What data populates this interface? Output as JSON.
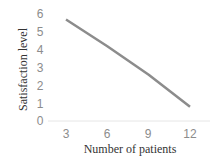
{
  "chart_data": {
    "type": "line",
    "title": "",
    "xlabel": "Number of patients",
    "ylabel": "Satisfaction level",
    "categories": [
      "3",
      "6",
      "9",
      "12"
    ],
    "x": [
      3,
      6,
      9,
      12
    ],
    "series": [
      {
        "name": "Satisfaction level",
        "values": [
          5.7,
          4.2,
          2.6,
          0.8
        ],
        "color": "#8c8c8c"
      }
    ],
    "yticks": [
      "0",
      "1",
      "2",
      "3",
      "4",
      "5",
      "6"
    ],
    "ylim": [
      0,
      6
    ],
    "grid": false,
    "legend": "none"
  }
}
